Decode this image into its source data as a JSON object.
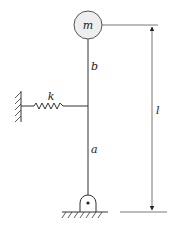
{
  "diagram": {
    "type": "mechanical-schematic",
    "labels": {
      "mass": "m",
      "upper_segment": "b",
      "lower_segment": "a",
      "spring": "k",
      "total_length": "l"
    },
    "colors": {
      "line": "#333333",
      "mass_fill": "#eeeeee",
      "background": "#ffffff"
    }
  }
}
